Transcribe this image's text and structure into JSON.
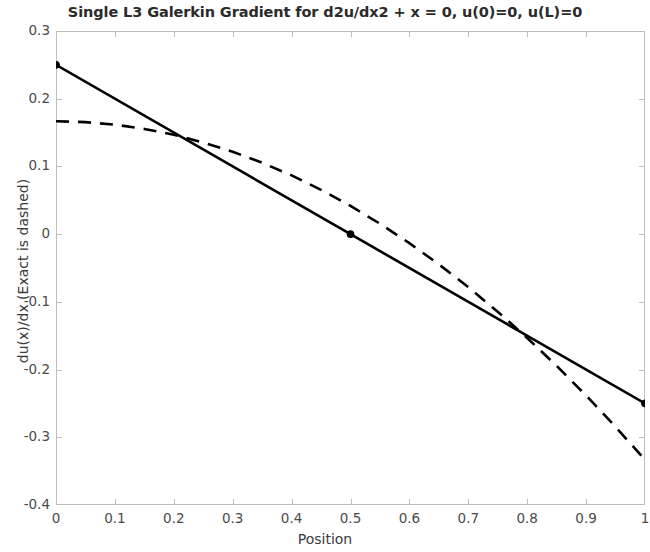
{
  "chart_data": {
    "type": "line",
    "title": "Single L3 Galerkin Gradient for d2u/dx2 + x = 0, u(0)=0, u(L)=0",
    "xlabel": "Position",
    "ylabel": "du(x)/dx  (Exact is dashed)",
    "xlim": [
      0,
      1
    ],
    "ylim": [
      -0.4,
      0.3
    ],
    "grid": false,
    "legend": "none",
    "xticks": [
      0,
      0.1,
      0.2,
      0.3,
      0.4,
      0.5,
      0.6,
      0.7,
      0.8,
      0.9,
      1
    ],
    "xticklabels": [
      "0",
      "0.1",
      "0.2",
      "0.3",
      "0.4",
      "0.5",
      "0.6",
      "0.7",
      "0.8",
      "0.9",
      "1"
    ],
    "yticks": [
      -0.4,
      -0.3,
      -0.2,
      -0.1,
      0,
      0.1,
      0.2,
      0.3
    ],
    "yticklabels": [
      "-0.4",
      "-0.3",
      "-0.2",
      "-0.1",
      "0",
      "0.1",
      "0.2",
      "0.3"
    ],
    "series": [
      {
        "name": "L3 Galerkin gradient",
        "style": "solid",
        "color": "#000000",
        "linewidth": 2.6,
        "marker": "circle",
        "markersize": 7,
        "x": [
          0,
          0.5,
          1
        ],
        "y": [
          0.25,
          0,
          -0.25
        ]
      },
      {
        "name": "Exact gradient",
        "style": "dashed",
        "color": "#000000",
        "linewidth": 2.6,
        "marker": "none",
        "x": [
          0,
          0.05,
          0.1,
          0.15,
          0.2,
          0.25,
          0.3,
          0.35,
          0.4,
          0.45,
          0.5,
          0.55,
          0.6,
          0.65,
          0.7,
          0.75,
          0.8,
          0.85,
          0.9,
          0.95,
          1
        ],
        "y": [
          0.1667,
          0.1654,
          0.1617,
          0.1554,
          0.1467,
          0.1354,
          0.1217,
          0.1054,
          0.0867,
          0.0654,
          0.0417,
          0.0154,
          -0.0133,
          -0.0446,
          -0.0783,
          -0.1146,
          -0.1533,
          -0.1946,
          -0.2383,
          -0.2846,
          -0.3333
        ]
      }
    ],
    "markers": [
      {
        "x": 0,
        "y": 0.25
      },
      {
        "x": 0.5,
        "y": 0
      },
      {
        "x": 1,
        "y": -0.25
      }
    ],
    "axis_color": "#bdbdbd",
    "background": "#ffffff"
  }
}
